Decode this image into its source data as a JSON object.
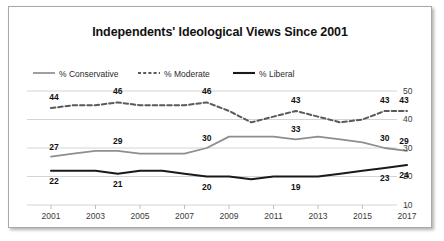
{
  "chart_data": {
    "type": "line",
    "title": "Independents' Ideological Views Since 2001",
    "xlabel": "",
    "ylabel": "",
    "ylim": [
      10,
      50
    ],
    "yticks": [
      10,
      20,
      30,
      40,
      50
    ],
    "grid": true,
    "legend_position": "top-left",
    "x": [
      2001,
      2002,
      2003,
      2004,
      2005,
      2006,
      2007,
      2008,
      2009,
      2010,
      2011,
      2012,
      2013,
      2014,
      2015,
      2016,
      2017
    ],
    "xticks": [
      "2001",
      "2003",
      "2005",
      "2007",
      "2009",
      "2011",
      "2013",
      "2015",
      "2017"
    ],
    "series": [
      {
        "name": "% Moderate",
        "style": "dashed",
        "color": "#5a5a5a",
        "values": [
          44,
          45,
          45,
          46,
          45,
          45,
          45,
          46,
          43,
          39,
          41,
          43,
          41,
          39,
          40,
          43,
          43
        ],
        "labels": [
          {
            "x": 2001,
            "value": 44
          },
          {
            "x": 2004,
            "value": 46
          },
          {
            "x": 2008,
            "value": 46
          },
          {
            "x": 2012,
            "value": 43
          },
          {
            "x": 2016,
            "value": 43
          },
          {
            "x": 2017,
            "value": 43
          }
        ]
      },
      {
        "name": "% Conservative",
        "style": "solid",
        "color": "#8e8e8e",
        "values": [
          27,
          28,
          29,
          29,
          28,
          28,
          28,
          30,
          34,
          34,
          34,
          33,
          34,
          33,
          32,
          30,
          29
        ],
        "labels": [
          {
            "x": 2001,
            "value": 27
          },
          {
            "x": 2004,
            "value": 29
          },
          {
            "x": 2008,
            "value": 30
          },
          {
            "x": 2012,
            "value": 33
          },
          {
            "x": 2016,
            "value": 30
          },
          {
            "x": 2017,
            "value": 29
          }
        ]
      },
      {
        "name": "% Liberal",
        "style": "solid",
        "color": "#1a1a1a",
        "values": [
          22,
          22,
          22,
          21,
          22,
          22,
          21,
          20,
          20,
          19,
          20,
          20,
          20,
          21,
          22,
          23,
          24
        ],
        "labels": [
          {
            "x": 2001,
            "value": 22
          },
          {
            "x": 2004,
            "value": 21
          },
          {
            "x": 2008,
            "value": 20
          },
          {
            "x": 2012,
            "value": 19
          },
          {
            "x": 2016,
            "value": 23
          },
          {
            "x": 2017,
            "value": 24
          }
        ]
      }
    ]
  },
  "legend": {
    "items": [
      {
        "label": "% Conservative",
        "style": "solid",
        "color": "#8e8e8e"
      },
      {
        "label": "% Moderate",
        "style": "dashed",
        "color": "#5a5a5a"
      },
      {
        "label": "% Liberal",
        "style": "solid",
        "color": "#1a1a1a"
      }
    ]
  }
}
